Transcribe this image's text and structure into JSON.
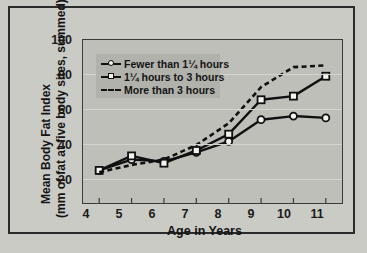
{
  "chart_data": {
    "type": "line",
    "title": "",
    "xlabel": "Age in Years",
    "ylabel": "Mean Body Fat Index (mm of fat at five body sites, summed)",
    "ylabel_line1": "Mean Body Fat Index",
    "ylabel_line2": "(mm of fat at five body sites, summed)",
    "x": [
      4,
      5,
      6,
      7,
      8,
      9,
      10,
      11
    ],
    "xticklabels": [
      "4",
      "5",
      "6",
      "7",
      "8",
      "9",
      "10",
      "11"
    ],
    "yticks": [
      20,
      40,
      60,
      80,
      100
    ],
    "yticklabels": [
      "20",
      "40",
      "60",
      "80",
      "100"
    ],
    "xlim": [
      3.5,
      11.5
    ],
    "ylim": [
      10,
      100
    ],
    "grid": "horizontal",
    "legend_position": "upper left inside",
    "series": [
      {
        "name": "Fewer than 1¼ hours",
        "marker": "circle",
        "linestyle": "solid",
        "values": [
          28,
          34,
          33,
          38,
          44,
          56,
          58,
          57
        ]
      },
      {
        "name": "1¼ hours to 3 hours",
        "marker": "square",
        "linestyle": "solid",
        "values": [
          28,
          36,
          32,
          39,
          48,
          67,
          69,
          80
        ]
      },
      {
        "name": "More than 3 hours",
        "marker": "none",
        "linestyle": "dashed",
        "values": [
          27,
          31,
          34,
          42,
          54,
          74,
          85,
          86
        ]
      }
    ]
  },
  "legend": {
    "items": [
      {
        "label": "Fewer than 1¼ hours"
      },
      {
        "label": "1¼ hours to 3 hours"
      },
      {
        "label": "More than 3 hours"
      }
    ]
  },
  "colors": {
    "line": "#101010",
    "marker_fill": "#f2f2ee",
    "panel_bg": "#bfbfba",
    "figure_bg": "#cbcbc6",
    "legend_bg": "#b2b2ad",
    "frame": "#2b2b2b",
    "gridline": "#d5d5d0"
  }
}
